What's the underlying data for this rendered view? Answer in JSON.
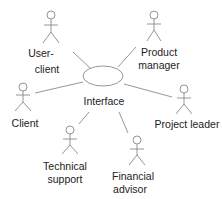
{
  "diagram": {
    "type": "use-case",
    "use_case": {
      "label": "Interface"
    },
    "actors": [
      {
        "id": "user-client",
        "lines": [
          "User-",
          "client"
        ]
      },
      {
        "id": "product-manager",
        "lines": [
          "Product",
          "manager"
        ]
      },
      {
        "id": "client",
        "lines": [
          "Client"
        ]
      },
      {
        "id": "project-leader",
        "lines": [
          "Project leader"
        ]
      },
      {
        "id": "technical-support",
        "lines": [
          "Technical",
          "support"
        ]
      },
      {
        "id": "financial-advisor",
        "lines": [
          "Financial",
          "advisor"
        ]
      }
    ],
    "colors": {
      "line": "#8a8a8a",
      "text": "#222222",
      "background": "#ffffff"
    }
  }
}
